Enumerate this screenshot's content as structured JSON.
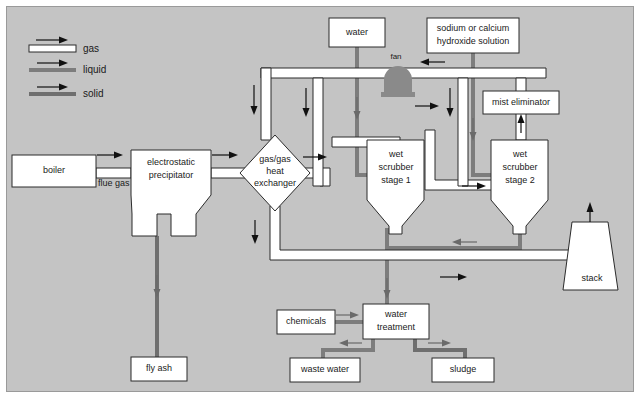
{
  "diagram": {
    "background_color": "#c4c4c4",
    "frame_border_color": "#9a9a9a",
    "legend": {
      "items": [
        {
          "label": "gas",
          "style": "white-pipe",
          "color": "#ffffff"
        },
        {
          "label": "liquid",
          "style": "gray-line",
          "color": "#7d7d7d"
        },
        {
          "label": "solid",
          "style": "gray-line",
          "color": "#6f6f6f"
        }
      ]
    },
    "nodes": [
      {
        "id": "boiler",
        "label": "boiler",
        "shape": "rect"
      },
      {
        "id": "electrostatic-precipitator",
        "label_line1": "electrostatic",
        "label_line2": "precipitator",
        "shape": "hopper"
      },
      {
        "id": "gas-gas-heat-exchanger",
        "label_line1": "gas/gas",
        "label_line2": "heat",
        "label_line3": "exchanger",
        "shape": "diamond"
      },
      {
        "id": "water",
        "label": "water",
        "shape": "rect"
      },
      {
        "id": "sodium-hydroxide-solution",
        "label_line1": "sodium or calcium",
        "label_line2": "hydroxide solution",
        "shape": "rect"
      },
      {
        "id": "fan",
        "label": "fan",
        "shape": "fan"
      },
      {
        "id": "mist-eliminator",
        "label": "mist eliminator",
        "shape": "rect"
      },
      {
        "id": "wet-scrubber-stage-1",
        "label_line1": "wet",
        "label_line2": "scrubber",
        "label_line3": "stage 1",
        "shape": "hopper"
      },
      {
        "id": "wet-scrubber-stage-2",
        "label_line1": "wet",
        "label_line2": "scrubber",
        "label_line3": "stage 2",
        "shape": "hopper"
      },
      {
        "id": "stack",
        "label": "stack",
        "shape": "trapezoid"
      },
      {
        "id": "fly-ash",
        "label": "fly ash",
        "shape": "rect"
      },
      {
        "id": "chemicals",
        "label": "chemicals",
        "shape": "rect"
      },
      {
        "id": "water-treatment",
        "label_line1": "water",
        "label_line2": "treatment",
        "shape": "rect"
      },
      {
        "id": "waste-water",
        "label": "waste water",
        "shape": "rect"
      },
      {
        "id": "sludge",
        "label": "sludge",
        "shape": "rect"
      }
    ],
    "edge_labels": [
      {
        "id": "flue-gas",
        "label": "flue gas"
      }
    ]
  }
}
